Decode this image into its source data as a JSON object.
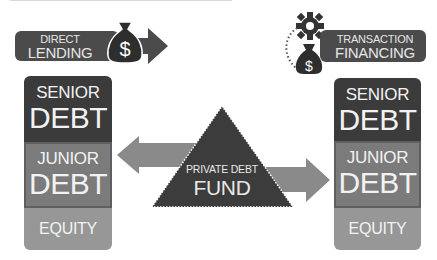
{
  "diagram": {
    "left_header": {
      "line1": "DIRECT",
      "line2": "LENDING",
      "icon": "money-bag-icon",
      "symbol": "$"
    },
    "right_header": {
      "line1": "TRANSACTION",
      "line2": "FINANCING",
      "icons": [
        "gear-icon",
        "money-bag-icon"
      ],
      "symbol": "$"
    },
    "left_stack": {
      "senior": {
        "line1": "SENIOR",
        "line2": "DEBT"
      },
      "junior": {
        "line1": "JUNIOR",
        "line2": "DEBT"
      },
      "equity": {
        "label": "EQUITY"
      }
    },
    "right_stack": {
      "senior": {
        "line1": "SENIOR",
        "line2": "DEBT"
      },
      "junior": {
        "line1": "JUNIOR",
        "line2": "DEBT"
      },
      "equity": {
        "label": "EQUITY"
      }
    },
    "center": {
      "line1": "PRIVATE DEBT",
      "line2": "FUND"
    },
    "colors": {
      "senior": "#3b3b3b",
      "junior": "#7b7b7b",
      "equity": "#979797",
      "arrow": "#8a8a8a",
      "triangle": "#3c3c3c",
      "banner": "#4b4b4b"
    }
  }
}
